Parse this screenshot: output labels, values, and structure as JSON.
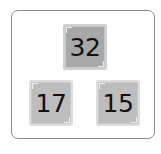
{
  "puzzle": {
    "top": {
      "value": "32"
    },
    "bottom_left": {
      "value": "17"
    },
    "bottom_right": {
      "value": "15"
    }
  },
  "colors": {
    "top_tile": "#a8a8a8",
    "bottom_tiles": "#bdbdbd",
    "board_border": "#8a8a8a"
  }
}
